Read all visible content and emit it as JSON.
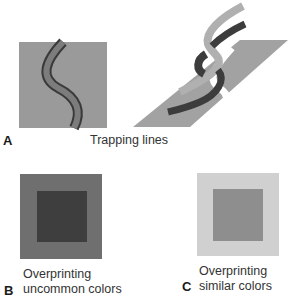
{
  "figure": {
    "panels": [
      {
        "letter": "A",
        "caption": "Trapping lines",
        "shapes": {
          "square_color": "#9a9a9a",
          "band_fill": "#7c7c7c",
          "band_outline": "#3a3a3a",
          "parallelogram_color": "#a2a2a2",
          "light_stroke_color": "#b0b0b0",
          "dark_stroke_color": "#3c3c3c"
        }
      },
      {
        "letter": "B",
        "caption_line1": "Overprinting",
        "caption_line2": "uncommon colors",
        "shapes": {
          "outer_color": "#6f6f6f",
          "inner_color": "#3e3e3e"
        }
      },
      {
        "letter": "C",
        "caption_line1": "Overprinting",
        "caption_line2": "similar colors",
        "shapes": {
          "outer_color": "#d0d0d0",
          "inner_color": "#8e8e8e"
        }
      }
    ]
  }
}
